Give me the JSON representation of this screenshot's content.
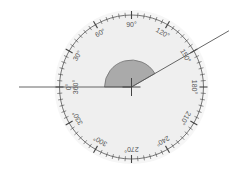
{
  "diagram": {
    "type": "protractor",
    "direction": "clockwise",
    "zero_position": "left",
    "labels": [
      {
        "angle": 0,
        "text": "0°"
      },
      {
        "angle": 0,
        "text": "360°",
        "secondary": true
      },
      {
        "angle": 30,
        "text": "30°"
      },
      {
        "angle": 60,
        "text": "60°"
      },
      {
        "angle": 90,
        "text": "90°"
      },
      {
        "angle": 120,
        "text": "120°"
      },
      {
        "angle": 150,
        "text": "150°"
      },
      {
        "angle": 180,
        "text": "180°"
      },
      {
        "angle": 210,
        "text": "210°"
      },
      {
        "angle": 240,
        "text": "240°"
      },
      {
        "angle": 270,
        "text": "270°"
      },
      {
        "angle": 300,
        "text": "300°"
      },
      {
        "angle": 330,
        "text": "330°"
      }
    ],
    "minor_tick_step_deg": 5,
    "major_tick_step_deg": 30,
    "measured_angle": {
      "from_deg": 0,
      "to_deg": 150,
      "value_deg": 150
    },
    "colors": {
      "disk": "#efefef",
      "halo": "#f6f6f6",
      "ring": "#555555",
      "ticks": "#444444",
      "wedge_fill": "#aaaaaa",
      "wedge_stroke": "#666666",
      "rays": "#555555",
      "labels": "#555555"
    }
  }
}
